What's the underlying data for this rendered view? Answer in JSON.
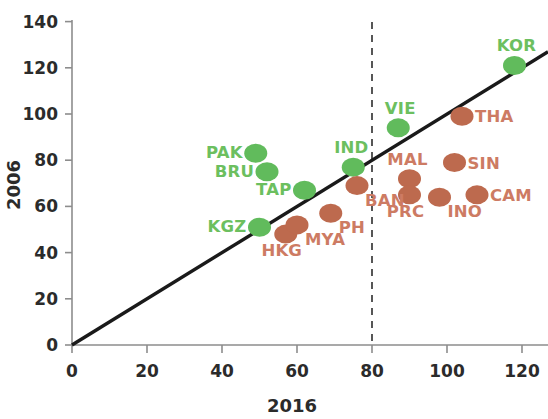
{
  "chart_data": {
    "type": "scatter",
    "title": "",
    "xlabel": "2016",
    "ylabel": "2006",
    "xlim": [
      0,
      130
    ],
    "ylim": [
      0,
      145
    ],
    "xticks": [
      0,
      20,
      40,
      60,
      80,
      100,
      120
    ],
    "yticks": [
      0,
      20,
      40,
      60,
      80,
      100,
      120,
      140
    ],
    "xtick_labels": [
      "0",
      "20",
      "40",
      "60",
      "80",
      "100",
      "120"
    ],
    "ytick_labels": [
      "0",
      "20",
      "40",
      "60",
      "80",
      "100",
      "120",
      "140"
    ],
    "grid": false,
    "legend": "none",
    "annotations": [
      {
        "name": "identity-line",
        "type": "line",
        "description": "45-degree reference line y = x",
        "from": [
          0,
          0
        ],
        "to": [
          130,
          130
        ]
      },
      {
        "name": "threshold-line",
        "type": "vertical-dashed",
        "description": "dashed vertical reference at x = 80",
        "x": 80
      }
    ],
    "series": [
      {
        "name": "above-or-on-line",
        "color": "#61bb5c",
        "label_color": "#6cbf5f",
        "points": [
          {
            "label": "PAK",
            "x": 49,
            "y": 83,
            "label_pos": "left"
          },
          {
            "label": "BRU",
            "x": 52,
            "y": 75,
            "label_pos": "left"
          },
          {
            "label": "TAP",
            "x": 62,
            "y": 67,
            "label_pos": "left"
          },
          {
            "label": "KGZ",
            "x": 50,
            "y": 51,
            "label_pos": "left"
          },
          {
            "label": "IND",
            "x": 75,
            "y": 77,
            "label_pos": "above-left"
          },
          {
            "label": "VIE",
            "x": 87,
            "y": 94,
            "label_pos": "above"
          },
          {
            "label": "KOR",
            "x": 118,
            "y": 121,
            "label_pos": "above"
          }
        ]
      },
      {
        "name": "below-line",
        "color": "#bd6a4e",
        "label_color": "#cd7b63",
        "points": [
          {
            "label": "HKG",
            "x": 57,
            "y": 48,
            "label_pos": "below-left"
          },
          {
            "label": "MYA",
            "x": 60,
            "y": 52,
            "label_pos": "below-right"
          },
          {
            "label": "PH",
            "x": 69,
            "y": 57,
            "label_pos": "below-right"
          },
          {
            "label": "BAN",
            "x": 76,
            "y": 69,
            "label_pos": "below-right"
          },
          {
            "label": "MAL",
            "x": 90,
            "y": 72,
            "label_pos": "above-left"
          },
          {
            "label": "PRC",
            "x": 90,
            "y": 65,
            "label_pos": "below-left"
          },
          {
            "label": "INO",
            "x": 98,
            "y": 64,
            "label_pos": "below-right"
          },
          {
            "label": "THA",
            "x": 104,
            "y": 99,
            "label_pos": "right"
          },
          {
            "label": "SIN",
            "x": 102,
            "y": 79,
            "label_pos": "right"
          },
          {
            "label": "CAM",
            "x": 108,
            "y": 65,
            "label_pos": "right"
          }
        ]
      }
    ]
  },
  "axes": {
    "x_title": "2016",
    "y_title": "2006"
  },
  "colors": {
    "green": "#61bb5c",
    "red": "#bd6a4e",
    "green_text": "#6cbf5f",
    "red_text": "#cd7b63",
    "axis": "#8d8d8d",
    "line": "#1a1a1a"
  }
}
